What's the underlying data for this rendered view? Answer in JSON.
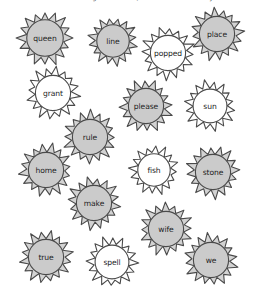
{
  "worksheet": {
    "instruction": "If the word has the long vowel sound, make it shine! Color it yellow.",
    "colors": {
      "filled": "#d3d3d3",
      "filled_inner": "#cbcbcb",
      "unfilled": "#ffffff",
      "outline": "#4a4a4a",
      "text": "#1d1d1d",
      "background": "#ffffff"
    },
    "suns": [
      {
        "word": "queen",
        "filled": true,
        "cx": 45,
        "cy": 38,
        "r": 27
      },
      {
        "word": "line",
        "filled": true,
        "cx": 113,
        "cy": 41,
        "r": 24
      },
      {
        "word": "popped",
        "filled": false,
        "cx": 168,
        "cy": 53,
        "r": 26
      },
      {
        "word": "place",
        "filled": true,
        "cx": 217,
        "cy": 34,
        "r": 26
      },
      {
        "word": "grant",
        "filled": false,
        "cx": 53,
        "cy": 93,
        "r": 26
      },
      {
        "word": "please",
        "filled": true,
        "cx": 146,
        "cy": 106,
        "r": 26
      },
      {
        "word": "sun",
        "filled": false,
        "cx": 210,
        "cy": 106,
        "r": 25
      },
      {
        "word": "rule",
        "filled": true,
        "cx": 90,
        "cy": 137,
        "r": 26
      },
      {
        "word": "home",
        "filled": true,
        "cx": 46,
        "cy": 170,
        "r": 26
      },
      {
        "word": "fish",
        "filled": false,
        "cx": 154,
        "cy": 170,
        "r": 24
      },
      {
        "word": "stone",
        "filled": true,
        "cx": 213,
        "cy": 172,
        "r": 26
      },
      {
        "word": "make",
        "filled": true,
        "cx": 94,
        "cy": 203,
        "r": 26
      },
      {
        "word": "wife",
        "filled": true,
        "cx": 166,
        "cy": 229,
        "r": 26
      },
      {
        "word": "true",
        "filled": true,
        "cx": 46,
        "cy": 257,
        "r": 26
      },
      {
        "word": "spell",
        "filled": false,
        "cx": 112,
        "cy": 262,
        "r": 25
      },
      {
        "word": "we",
        "filled": true,
        "cx": 211,
        "cy": 260,
        "r": 26
      }
    ]
  }
}
